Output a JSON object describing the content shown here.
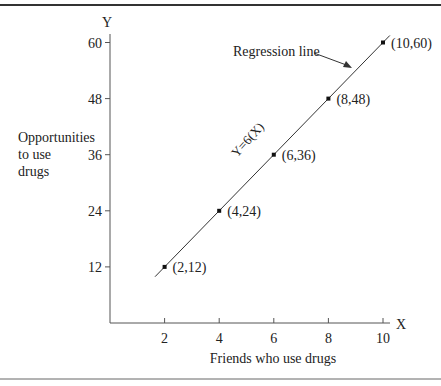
{
  "chart_data": {
    "type": "scatter",
    "title": "",
    "xlabel": "Friends who use drugs",
    "ylabel": "Opportunities to use drugs",
    "ylabel_lines": [
      "Opportunities",
      "to use",
      "drugs"
    ],
    "x_axis_letter": "X",
    "y_axis_letter": "Y",
    "x_ticks": [
      2,
      4,
      6,
      8,
      10
    ],
    "y_ticks": [
      12,
      24,
      36,
      48,
      60
    ],
    "xlim": [
      0,
      10.5
    ],
    "ylim": [
      0,
      62
    ],
    "grid": false,
    "points": [
      {
        "x": 2,
        "y": 12,
        "label": "(2,12)"
      },
      {
        "x": 4,
        "y": 24,
        "label": "(4,24)"
      },
      {
        "x": 6,
        "y": 36,
        "label": "(6,36)"
      },
      {
        "x": 8,
        "y": 48,
        "label": "(8,48)"
      },
      {
        "x": 10,
        "y": 60,
        "label": "(10,60)"
      }
    ],
    "regression": {
      "equation": "Y=6(X)",
      "slope": 6,
      "intercept": 0,
      "x_range": [
        1.65,
        10.25
      ]
    },
    "annotations": [
      {
        "text": "Regression line",
        "arrow_to": "line near (8.7, 52)"
      },
      {
        "text": "Y=6(X)",
        "rotated": true
      }
    ]
  }
}
